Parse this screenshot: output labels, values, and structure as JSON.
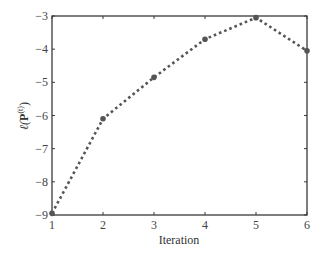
{
  "chart_data": {
    "type": "line",
    "title": "",
    "xlabel": "Iteration",
    "ylabel": "ℓ(P^(t))",
    "ylabel_parts": {
      "ell": "ℓ(",
      "P": "P",
      "sup": "(t)",
      "close": ")"
    },
    "x": [
      1,
      2,
      3,
      4,
      5,
      6
    ],
    "series": [
      {
        "name": "log-likelihood",
        "values": [
          -8.95,
          -6.1,
          -4.85,
          -3.7,
          -3.05,
          -4.05
        ],
        "color": "#555555",
        "line_style": "dotted",
        "marker": "circle"
      }
    ],
    "xlim": [
      1,
      6
    ],
    "ylim": [
      -9,
      -3
    ],
    "xticks": [
      1,
      2,
      3,
      4,
      5,
      6
    ],
    "yticks": [
      -3,
      -4,
      -5,
      -6,
      -7,
      -8,
      -9
    ],
    "ytick_labels": [
      "−3",
      "−4",
      "−5",
      "−6",
      "−7",
      "−8",
      "−9"
    ],
    "xtick_labels": [
      "1",
      "2",
      "3",
      "4",
      "5",
      "6"
    ],
    "grid": false,
    "legend": null
  }
}
